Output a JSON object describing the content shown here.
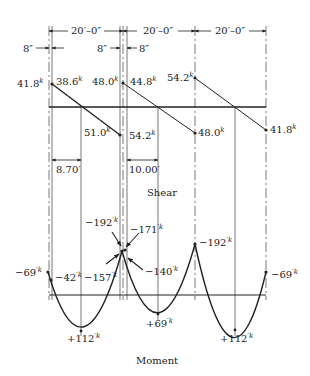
{
  "dimensions": {
    "spans": [
      "20′–0″",
      "20′–0″",
      "20′–0″"
    ],
    "column_widths": [
      "8″",
      "8″",
      "8″"
    ],
    "zero_shear_distances": [
      "8.70′",
      "10.00′"
    ]
  },
  "shear": {
    "title": "Shear",
    "unit_sup": "k",
    "values": {
      "span1_left_outer": "41.8",
      "span1_left_inner": "38.6",
      "span1_right_inner": "51.0",
      "span1_right_outer": "54.2",
      "span2_left_outer": "48.0",
      "span2_left_inner": "44.8",
      "span2_right": "48.0",
      "span3_left": "54.2",
      "span3_right": "41.8"
    }
  },
  "moment": {
    "title": "Moment",
    "unit_sup": "′k",
    "values": {
      "left_end_outer": "−69",
      "left_end_inner": "−42",
      "support2_top_left": "−192",
      "support2_top_right": "−171",
      "support2_face_left": "−157",
      "support2_face_right": "−140",
      "support3_top": "−192",
      "right_end": "−69",
      "span1_max": "+112",
      "span2_max": "+69",
      "span3_max": "+112"
    }
  },
  "colors": {
    "line": "#222222",
    "grid": "#555555",
    "background": "#ffffff"
  }
}
